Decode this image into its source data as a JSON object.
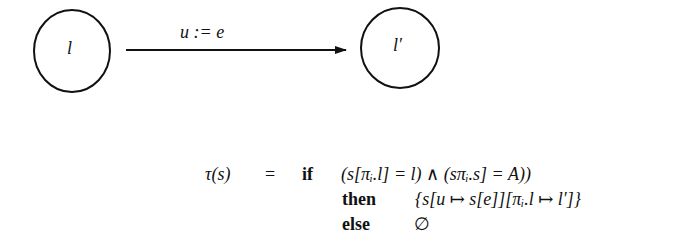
{
  "diagram": {
    "states": [
      {
        "id": "source",
        "label": "l",
        "cx": 72,
        "cy": 51,
        "rx": 38,
        "ry": 41
      },
      {
        "id": "target",
        "label": "l′",
        "cx": 400,
        "cy": 48,
        "rx": 39,
        "ry": 40
      }
    ],
    "transition": {
      "from": "source",
      "to": "target",
      "label": "u := e",
      "x1": 126,
      "y1": 50,
      "x2": 346,
      "y2": 50
    }
  },
  "formula": {
    "lhs": "τ(s)",
    "eq": "=",
    "lines": [
      {
        "keyword": "if",
        "expr": "(s[πᵢ.l] = l) ∧ (sπᵢ.s] = A))"
      },
      {
        "keyword": "then",
        "expr": "{s[u ↦ s[e]][πᵢ.l ↦ l′]}"
      },
      {
        "keyword": "else",
        "expr": "∅"
      }
    ]
  }
}
